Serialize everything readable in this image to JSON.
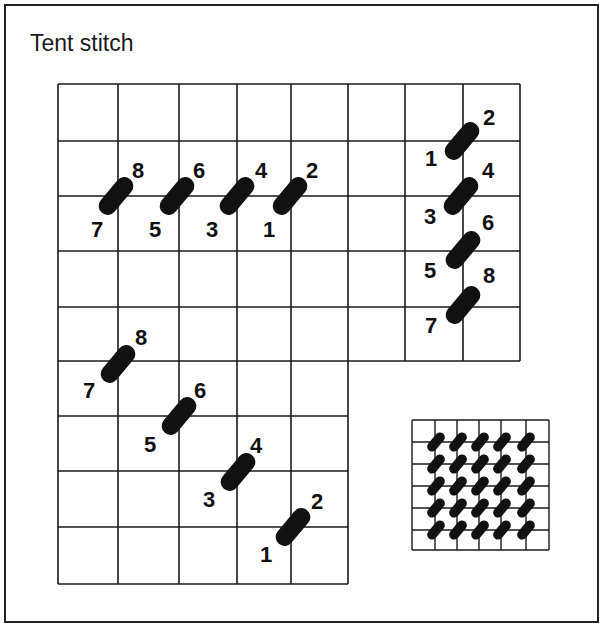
{
  "title": "Tent stitch",
  "colors": {
    "ink": "#111111",
    "background": "#ffffff"
  },
  "rows": {
    "horizontal_row": {
      "labels_top": [
        "8",
        "6",
        "4",
        "2"
      ],
      "labels_bottom": [
        "7",
        "5",
        "3",
        "1"
      ]
    },
    "vertical_column": {
      "labels_left": [
        "1",
        "3",
        "5",
        "7"
      ],
      "labels_right": [
        "2",
        "4",
        "6",
        "8"
      ]
    },
    "diagonal_row": {
      "labels_top": [
        "8",
        "6",
        "4",
        "2"
      ],
      "labels_bottom": [
        "7",
        "5",
        "3",
        "1"
      ]
    }
  },
  "sample_swatch": {
    "description": "finished tent stitch sample",
    "grid": "6x6",
    "stitches": "5x5"
  }
}
